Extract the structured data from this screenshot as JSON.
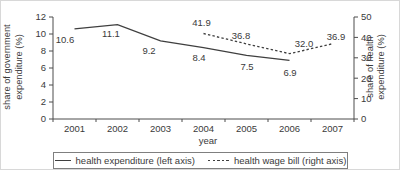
{
  "chart_data": {
    "type": "line",
    "title": "",
    "x_categories": [
      "2001",
      "2002",
      "2003",
      "2004",
      "2005",
      "2006",
      "2007"
    ],
    "xlabel": "year",
    "grid": false,
    "legend_position": "bottom",
    "left_axis": {
      "title": "share of government expenditure (%)",
      "title_line1": "share of government",
      "title_line2": "expenditure (%)",
      "ticks": [
        0,
        2,
        4,
        6,
        8,
        10,
        12
      ],
      "range": [
        0,
        12
      ]
    },
    "right_axis": {
      "title": "share of health expenditure (%)",
      "title_line1": "share of health",
      "title_line2": "expenditure (%)",
      "ticks": [
        0,
        10,
        20,
        30,
        40,
        50
      ],
      "range": [
        0,
        50
      ]
    },
    "series": [
      {
        "name": "health expenditure (left axis)",
        "axis": "left",
        "line_style": "solid",
        "x": [
          "2001",
          "2002",
          "2003",
          "2004",
          "2005",
          "2006"
        ],
        "values": [
          10.6,
          11.1,
          9.2,
          8.4,
          7.5,
          6.9
        ],
        "labels": [
          "10.6",
          "11.1",
          "9.2",
          "8.4",
          "7.5",
          "6.9"
        ]
      },
      {
        "name": "health wage bill (right axis)",
        "axis": "right",
        "line_style": "dashed",
        "x": [
          "2004",
          "2005",
          "2006",
          "2007"
        ],
        "values": [
          41.9,
          36.8,
          32.0,
          36.9
        ],
        "labels": [
          "41.9",
          "36.8",
          "32.0",
          "36.9"
        ]
      }
    ],
    "colors": {
      "line": "#3f3f3f",
      "text": "#3a3a3a",
      "axis": "#4d4d4d",
      "legend_border": "#7f7f7f",
      "background": "#ffffff"
    }
  }
}
